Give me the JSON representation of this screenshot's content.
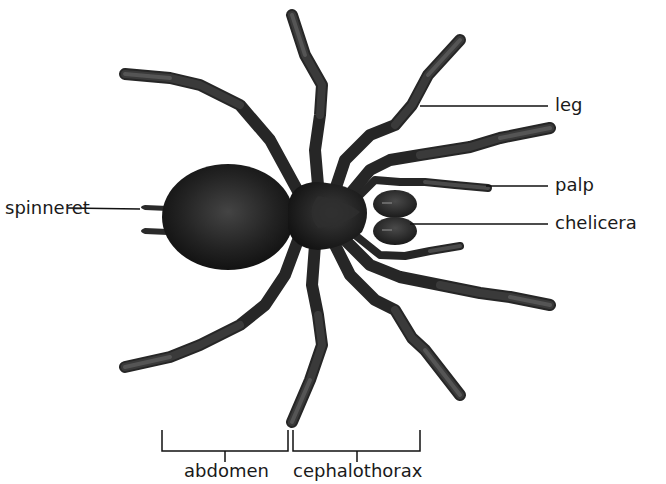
{
  "diagram": {
    "background": "#ffffff",
    "body_color": "#1c1c1c",
    "leg_color": "#2e2e2e",
    "line_color": "#111111",
    "labels": {
      "spinneret": "spinneret",
      "leg": "leg",
      "palp": "palp",
      "chelicera": "chelicera",
      "abdomen": "abdomen",
      "cephalothorax": "cephalothorax"
    },
    "regions": [
      {
        "name": "abdomen",
        "bracket_x": [
          162,
          288
        ]
      },
      {
        "name": "cephalothorax",
        "bracket_x": [
          293,
          420
        ]
      }
    ]
  }
}
